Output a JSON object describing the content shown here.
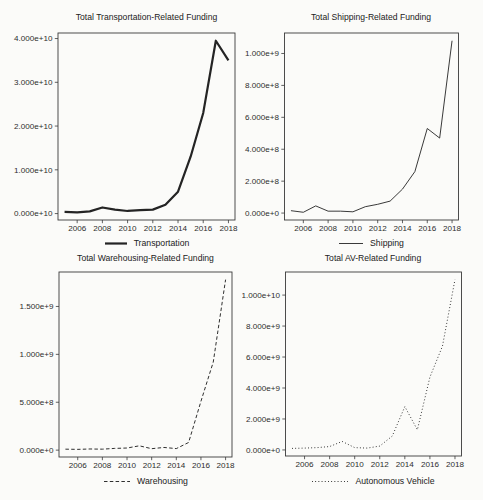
{
  "chart_data": [
    {
      "type": "line",
      "title": "Total Transportation-Related Funding",
      "legend_label": "Transportation",
      "line": {
        "name": "solid-thick",
        "width": 2.2,
        "dash": ""
      },
      "x": [
        2005,
        2006,
        2007,
        2008,
        2009,
        2010,
        2011,
        2012,
        2013,
        2014,
        2015,
        2016,
        2017,
        2018
      ],
      "values": [
        400000000,
        300000000,
        500000000,
        1400000000,
        900000000,
        600000000,
        800000000,
        900000000,
        2000000000,
        5000000000,
        13000000000,
        23000000000,
        39500000000,
        35000000000
      ],
      "ylim": [
        0,
        40000000000
      ],
      "ytick_values": [
        0,
        10000000000,
        20000000000,
        30000000000,
        40000000000
      ],
      "ytick_labels": [
        "0.000e+10",
        "1.000e+10",
        "2.000e+10",
        "3.000e+10",
        "4.000e+10"
      ],
      "xtick_values": [
        2006,
        2008,
        2010,
        2012,
        2014,
        2016,
        2018
      ],
      "xtick_labels": [
        "2006",
        "2008",
        "2010",
        "2012",
        "2014",
        "2016",
        "2018"
      ],
      "grid": "off",
      "legend_position": "bottom"
    },
    {
      "type": "line",
      "title": "Total Shipping-Related Funding",
      "legend_label": "Shipping",
      "line": {
        "name": "solid-thin",
        "width": 0.9,
        "dash": ""
      },
      "x": [
        2005,
        2006,
        2007,
        2008,
        2009,
        2010,
        2011,
        2012,
        2013,
        2014,
        2015,
        2016,
        2017,
        2018
      ],
      "values": [
        15000000,
        5000000,
        45000000,
        12000000,
        12000000,
        8000000,
        40000000,
        55000000,
        75000000,
        150000000,
        260000000,
        530000000,
        470000000,
        1080000000
      ],
      "ylim": [
        0,
        1080000000
      ],
      "ytick_values": [
        0,
        200000000,
        400000000,
        600000000,
        800000000,
        1000000000
      ],
      "ytick_labels": [
        "0.000e+0",
        "2.000e+8",
        "4.000e+8",
        "6.000e+8",
        "8.000e+8",
        "1.000e+9"
      ],
      "xtick_values": [
        2006,
        2008,
        2010,
        2012,
        2014,
        2016,
        2018
      ],
      "xtick_labels": [
        "2006",
        "2008",
        "2010",
        "2012",
        "2014",
        "2016",
        "2018"
      ],
      "grid": "off",
      "legend_position": "bottom"
    },
    {
      "type": "line",
      "title": "Total Warehousing-Related Funding",
      "legend_label": "Warehousing",
      "line": {
        "name": "dashed",
        "width": 0.95,
        "dash": "3.5 2.3"
      },
      "x": [
        2005,
        2006,
        2007,
        2008,
        2009,
        2010,
        2011,
        2012,
        2013,
        2014,
        2015,
        2016,
        2017,
        2018
      ],
      "values": [
        10000000,
        8000000,
        12000000,
        10000000,
        18000000,
        22000000,
        45000000,
        15000000,
        28000000,
        16000000,
        80000000,
        510000000,
        920000000,
        1780000000
      ],
      "ylim": [
        0,
        1780000000
      ],
      "ytick_values": [
        0,
        500000000,
        1000000000,
        1500000000
      ],
      "ytick_labels": [
        "0.000e+0",
        "5.000e+8",
        "1.000e+9",
        "1.500e+9"
      ],
      "xtick_values": [
        2006,
        2008,
        2010,
        2012,
        2014,
        2016,
        2018
      ],
      "xtick_labels": [
        "2006",
        "2008",
        "2010",
        "2012",
        "2014",
        "2016",
        "2018"
      ],
      "grid": "off",
      "legend_position": "bottom"
    },
    {
      "type": "line",
      "title": "Total AV-Related Funding",
      "legend_label": "Autonomous Vehicle",
      "line": {
        "name": "dotted",
        "width": 1,
        "dash": "0.9 2.3"
      },
      "x": [
        2005,
        2006,
        2007,
        2008,
        2009,
        2010,
        2011,
        2012,
        2013,
        2014,
        2015,
        2016,
        2017,
        2018
      ],
      "values": [
        100000000,
        120000000,
        150000000,
        220000000,
        550000000,
        150000000,
        120000000,
        250000000,
        900000000,
        2800000000,
        1300000000,
        4700000000,
        6700000000,
        11000000000
      ],
      "ylim": [
        0,
        11000000000
      ],
      "ytick_values": [
        0,
        2000000000,
        4000000000,
        6000000000,
        8000000000,
        10000000000
      ],
      "ytick_labels": [
        "0.000e+0",
        "2.000e+9",
        "4.000e+9",
        "6.000e+9",
        "8.000e+9",
        "1.000e+10"
      ],
      "xtick_values": [
        2006,
        2008,
        2010,
        2012,
        2014,
        2016,
        2018
      ],
      "xtick_labels": [
        "2006",
        "2008",
        "2010",
        "2012",
        "2014",
        "2016",
        "2018"
      ],
      "grid": "off",
      "legend_position": "bottom"
    }
  ],
  "colors": {
    "line": "#242424",
    "axis_box": "#3a3a3a",
    "text": "#2d2d2d",
    "background": "#fbfbf9"
  }
}
